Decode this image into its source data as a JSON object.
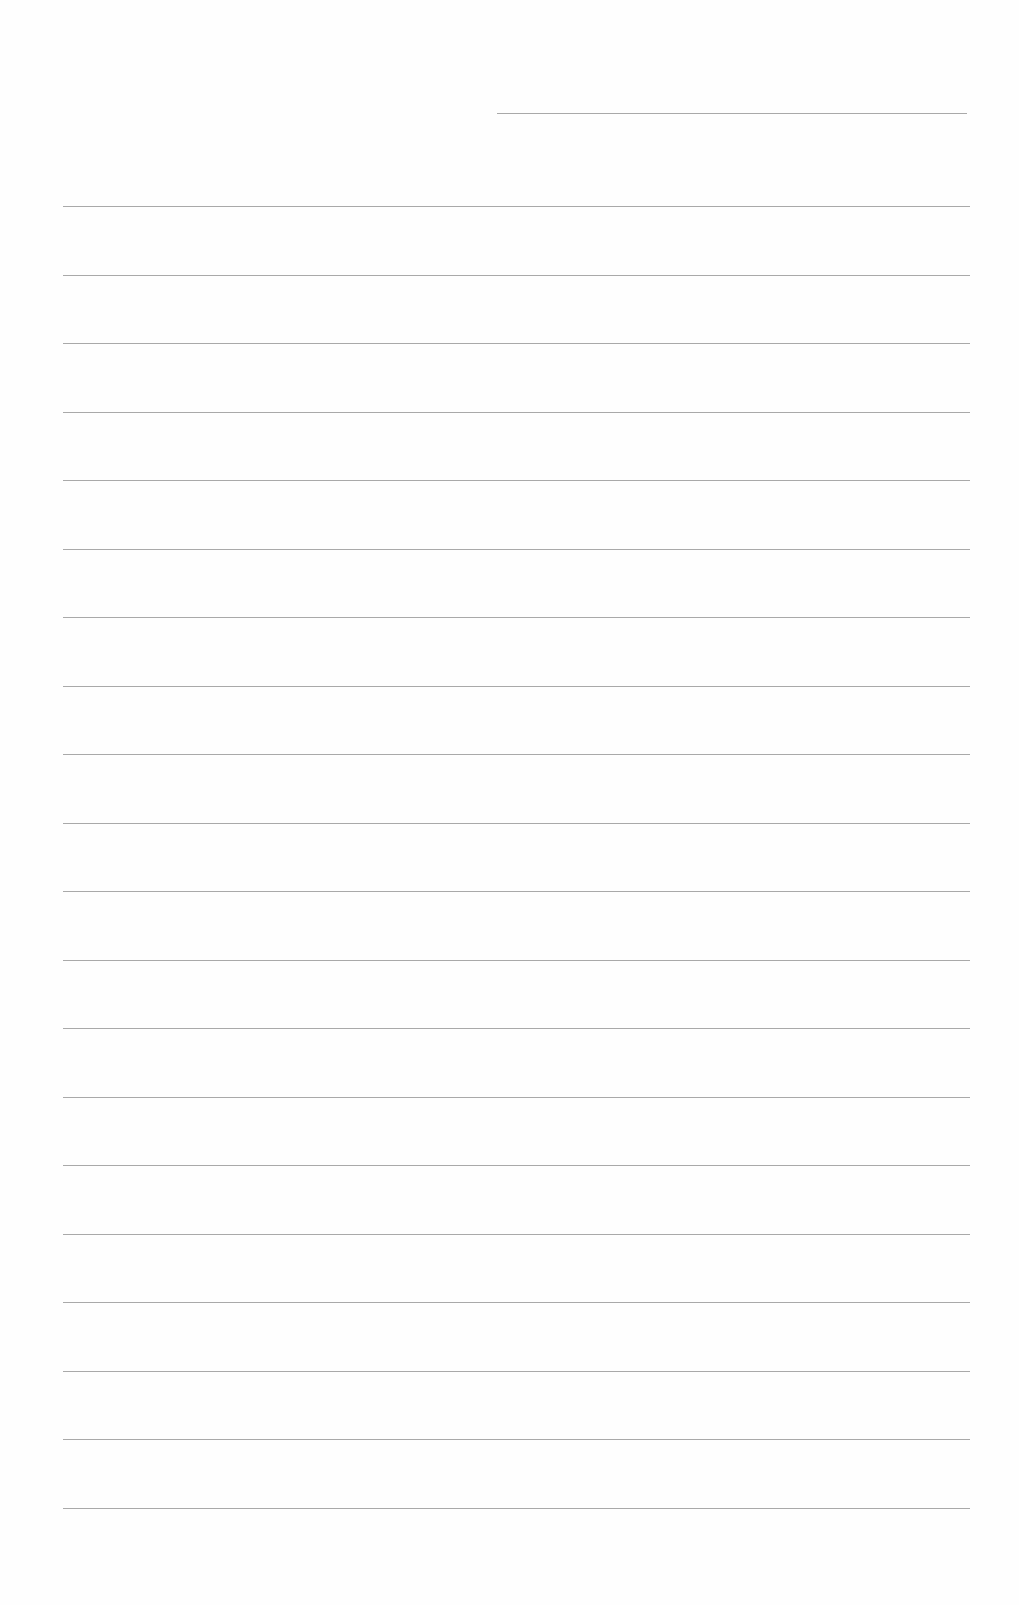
{
  "document": {
    "type": "blank lined writing page",
    "header_line": {
      "present": true,
      "y": 113,
      "x_start": 497,
      "x_end": 967
    },
    "ruled_lines": {
      "count": 20,
      "first_y": 206,
      "spacing": 68.5,
      "x_start": 63,
      "x_end": 970
    },
    "line_color": "#9a9a9a",
    "background_color": "#fefefe",
    "text_content": ""
  }
}
